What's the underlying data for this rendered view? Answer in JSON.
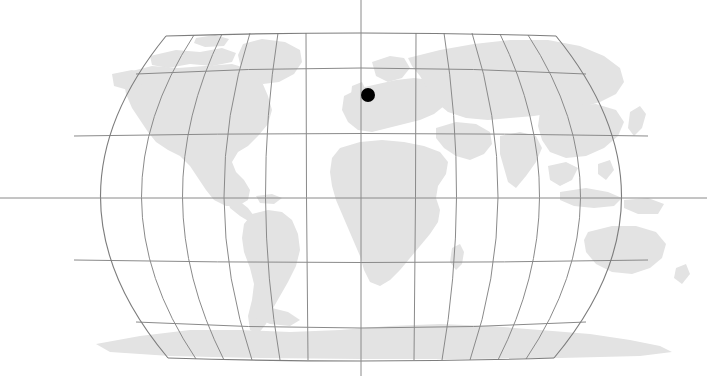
{
  "figure": {
    "kind": "world-locator-map",
    "title": "",
    "width": 707,
    "height": 376,
    "background_color": "#ffffff"
  },
  "map": {
    "projection": "Robinson",
    "central_meridian_degrees": 0,
    "land_fill_color": "#e3e3e3",
    "graticule_color": "#8a8a8a",
    "frame_color": "#7d7d7d",
    "graticule_interval_degrees": 30,
    "latitude_labels": [
      "90N",
      "60N",
      "30N",
      "0",
      "30S",
      "60S",
      "90S"
    ],
    "longitude_labels": [
      "180W",
      "150W",
      "120W",
      "90W",
      "60W",
      "30W",
      "0",
      "30E",
      "60E",
      "90E",
      "120E",
      "150E",
      "180E"
    ],
    "bounds_px": {
      "left": 34,
      "right": 688,
      "top": 33,
      "bottom": 360,
      "center_x": 361,
      "equator_y": 198
    },
    "axis_lines": {
      "equator_spans_full_width": true,
      "central_meridian_spans_full_height": true
    }
  },
  "marker": {
    "label": "",
    "shape": "filled-circle",
    "color": "#000000",
    "radius_px": 7,
    "position_px": {
      "x": 368,
      "y": 95
    },
    "approx_location": {
      "latitude": 52.5,
      "longitude": 4.0
    },
    "region": "Western Europe"
  },
  "landmasses": [
    {
      "name": "north-america"
    },
    {
      "name": "south-america"
    },
    {
      "name": "greenland"
    },
    {
      "name": "africa"
    },
    {
      "name": "europe"
    },
    {
      "name": "asia"
    },
    {
      "name": "australia"
    },
    {
      "name": "antarctica"
    }
  ]
}
